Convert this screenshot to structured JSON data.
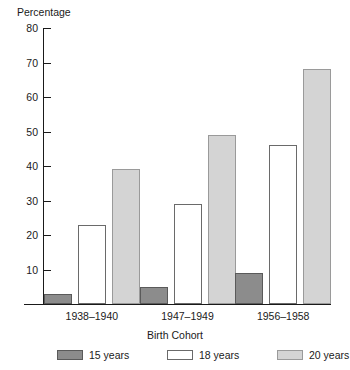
{
  "chart_data": {
    "type": "bar",
    "title": "",
    "ylabel": "Percentage",
    "xlabel": "Birth Cohort",
    "categories": [
      "1938–1940",
      "1947–1949",
      "1956–1958"
    ],
    "series": [
      {
        "name": "15 years",
        "values": [
          3,
          5,
          9
        ],
        "color": "#8c8c8c"
      },
      {
        "name": "18 years",
        "values": [
          23,
          29,
          46
        ],
        "color": "#ffffff"
      },
      {
        "name": "20 years",
        "values": [
          39,
          49,
          68
        ],
        "color": "#d4d4d4"
      }
    ],
    "ylim": [
      0,
      80
    ],
    "yticks": [
      10,
      20,
      30,
      40,
      50,
      60,
      70,
      80
    ],
    "ytick_labels": [
      "10",
      "20",
      "30",
      "40",
      "50",
      "60",
      "70",
      "80"
    ],
    "grid": false,
    "legend_position": "bottom"
  }
}
